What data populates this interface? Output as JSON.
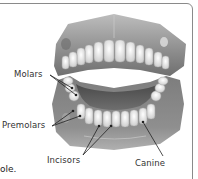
{
  "figure": {
    "labels": {
      "molars": "Molars",
      "premolars": "Premolars",
      "incisors": "Incisors",
      "canine": "Canine"
    },
    "colors": {
      "border": "#8a8a8a",
      "gum": "#7a7a7a",
      "tooth": "#f2f2f2",
      "tongue": "#5e5e5e",
      "leader_line": "#222222"
    }
  },
  "body": {
    "partial_text": "ole."
  }
}
